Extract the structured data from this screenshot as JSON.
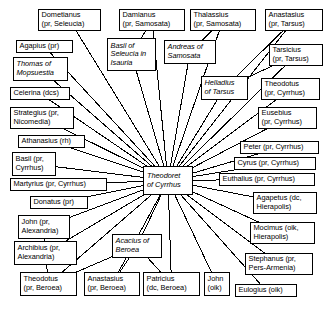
{
  "diagram": {
    "type": "radial-network",
    "background_color": "#ffffff",
    "line_color": "#000000",
    "box_border_color": "#000000",
    "center": {
      "id": "theodoret",
      "label": "Theodoret\nof Cyrrhus",
      "line1": "Theodoret",
      "line2": "of Cyrrhus",
      "style": "italic",
      "x": 143,
      "y": 166,
      "w": 50,
      "h": 29
    },
    "nodes": [
      {
        "id": "dometianus",
        "line1": "Dometianus",
        "line2": "(pr, Seleucia)",
        "style": "normal",
        "x": 38,
        "y": 9,
        "w": 63,
        "h": 22,
        "anchor": "br"
      },
      {
        "id": "damianus",
        "line1": "Damianus",
        "line2": "(pr, Samosata)",
        "style": "normal",
        "x": 119,
        "y": 9,
        "w": 66,
        "h": 22,
        "anchor": "b"
      },
      {
        "id": "thalassius",
        "line1": "Thalassius",
        "line2": "(pr, Samosata)",
        "style": "normal",
        "x": 190,
        "y": 9,
        "w": 66,
        "h": 22,
        "anchor": "b"
      },
      {
        "id": "anastasius-tarsus",
        "line1": "Anastasius",
        "line2": "(pr, Tarsus)",
        "style": "normal",
        "x": 265,
        "y": 9,
        "w": 58,
        "h": 22,
        "anchor": "bl"
      },
      {
        "id": "agapius",
        "line1": "Agapius (pr)",
        "line2": "",
        "style": "normal",
        "x": 16,
        "y": 40,
        "w": 57,
        "h": 13,
        "anchor": "br"
      },
      {
        "id": "basil-seleucia",
        "line1": "Basil of",
        "line2": "Seleucia in",
        "line3": "Isauria",
        "style": "italic",
        "x": 107,
        "y": 38,
        "w": 49,
        "h": 33,
        "anchor": "br"
      },
      {
        "id": "andreas-samosata",
        "line1": "Andreas of",
        "line2": "Samosata",
        "style": "italic",
        "x": 164,
        "y": 40,
        "w": 52,
        "h": 24,
        "anchor": "b"
      },
      {
        "id": "tarsicius",
        "line1": "Tarsicius",
        "line2": "(pr, Tarsus)",
        "style": "normal",
        "x": 269,
        "y": 44,
        "w": 54,
        "h": 22,
        "anchor": "bl"
      },
      {
        "id": "thomas-mopsuestia",
        "line1": "Thomas of",
        "line2": "Mopsuestia",
        "style": "italic",
        "x": 13,
        "y": 57,
        "w": 55,
        "h": 24,
        "anchor": "br"
      },
      {
        "id": "helladius-tarsus",
        "line1": "Helladius",
        "line2": "of Tarsus",
        "style": "italic",
        "x": 201,
        "y": 76,
        "w": 47,
        "h": 24,
        "anchor": "bl"
      },
      {
        "id": "theodotus-cyrrhus",
        "line1": "Theodotus",
        "line2": "(pr, Cyrrhus)",
        "style": "normal",
        "x": 261,
        "y": 78,
        "w": 59,
        "h": 22,
        "anchor": "bl"
      },
      {
        "id": "celerina",
        "line1": "Celerina (dcs)",
        "line2": "",
        "style": "normal",
        "x": 10,
        "y": 87,
        "w": 60,
        "h": 13,
        "anchor": "r"
      },
      {
        "id": "eusebius",
        "line1": "Eusebius",
        "line2": "(pr, Cyrrhus)",
        "style": "normal",
        "x": 258,
        "y": 107,
        "w": 59,
        "h": 22,
        "anchor": "l"
      },
      {
        "id": "strategius",
        "line1": "Strategius (pr,",
        "line2": "Nicomedia)",
        "style": "normal",
        "x": 10,
        "y": 107,
        "w": 64,
        "h": 22,
        "anchor": "r"
      },
      {
        "id": "athanasius",
        "line1": "Athanasius (rh)",
        "line2": "",
        "style": "normal",
        "x": 18,
        "y": 135,
        "w": 67,
        "h": 13,
        "anchor": "r"
      },
      {
        "id": "peter",
        "line1": "Peter (pr, Cyrrhus)",
        "line2": "",
        "style": "normal",
        "x": 240,
        "y": 141,
        "w": 79,
        "h": 13,
        "anchor": "l"
      },
      {
        "id": "cyrus",
        "line1": "Cyrus (pr, Cyrrhus)",
        "line2": "",
        "style": "normal",
        "x": 234,
        "y": 157,
        "w": 82,
        "h": 13,
        "anchor": "l"
      },
      {
        "id": "basil-cyrrhus",
        "line1": "Basil (pr,",
        "line2": "Cyrrhus)",
        "style": "normal",
        "x": 12,
        "y": 152,
        "w": 44,
        "h": 24,
        "anchor": "r"
      },
      {
        "id": "euthalius",
        "line1": "Euthalius (pr, Cyrrhus)",
        "line2": "",
        "style": "normal",
        "x": 219,
        "y": 173,
        "w": 96,
        "h": 13,
        "anchor": "l"
      },
      {
        "id": "martyrius",
        "line1": "Martyrius (pr, Cyrrhus)",
        "line2": "",
        "style": "normal",
        "x": 10,
        "y": 178,
        "w": 97,
        "h": 13,
        "anchor": "r"
      },
      {
        "id": "agapetus",
        "line1": "Agapetus (dc,",
        "line2": "Hierapolis)",
        "style": "normal",
        "x": 253,
        "y": 192,
        "w": 64,
        "h": 22,
        "anchor": "l"
      },
      {
        "id": "donatus",
        "line1": "Donatus (pr)",
        "line2": "",
        "style": "normal",
        "x": 30,
        "y": 196,
        "w": 58,
        "h": 13,
        "anchor": "r"
      },
      {
        "id": "mocimus",
        "line1": "Mocimus (oik,",
        "line2": "Hierapolis)",
        "style": "normal",
        "x": 250,
        "y": 222,
        "w": 65,
        "h": 22,
        "anchor": "l"
      },
      {
        "id": "john-alexandria",
        "line1": "John (pr,",
        "line2": "Alexandria)",
        "style": "normal",
        "x": 18,
        "y": 215,
        "w": 52,
        "h": 24,
        "anchor": "r"
      },
      {
        "id": "archibius",
        "line1": "Archibius (pr,",
        "line2": "Alexandria)",
        "style": "normal",
        "x": 14,
        "y": 241,
        "w": 63,
        "h": 24,
        "anchor": "r"
      },
      {
        "id": "acacius-beroea",
        "line1": "Acacius of",
        "line2": "Beroea",
        "style": "italic",
        "x": 112,
        "y": 234,
        "w": 50,
        "h": 24,
        "anchor": "t"
      },
      {
        "id": "stephanus",
        "line1": "Stephanus (pr,",
        "line2": "Pers-Armenia)",
        "style": "normal",
        "x": 245,
        "y": 253,
        "w": 68,
        "h": 22,
        "anchor": "tl"
      },
      {
        "id": "theodotus-beroea",
        "line1": "Theodotus",
        "line2": "(pr, Beroea)",
        "style": "normal",
        "x": 20,
        "y": 272,
        "w": 57,
        "h": 24,
        "anchor": "t"
      },
      {
        "id": "anastasius-beroea",
        "line1": "Anastasius",
        "line2": "(pr, Beroea)",
        "style": "normal",
        "x": 84,
        "y": 272,
        "w": 56,
        "h": 24,
        "anchor": "t"
      },
      {
        "id": "patricius",
        "line1": "Patricius",
        "line2": "(dc, Beroea)",
        "style": "normal",
        "x": 143,
        "y": 272,
        "w": 57,
        "h": 24,
        "anchor": "t"
      },
      {
        "id": "john-oik",
        "line1": "John",
        "line2": "(oik)",
        "style": "normal",
        "x": 204,
        "y": 272,
        "w": 26,
        "h": 24,
        "anchor": "t"
      },
      {
        "id": "eulogius",
        "line1": "Eulogius (oik)",
        "line2": "",
        "style": "normal",
        "x": 235,
        "y": 284,
        "w": 62,
        "h": 13,
        "anchor": "tl"
      }
    ],
    "edges": [
      {
        "from": "dometianus",
        "to": "theodoret"
      },
      {
        "from": "damianus",
        "to": "theodoret"
      },
      {
        "from": "thalassius",
        "to": "theodoret"
      },
      {
        "from": "anastasius-tarsus",
        "to": "theodoret"
      },
      {
        "from": "agapius",
        "to": "theodoret"
      },
      {
        "from": "basil-seleucia",
        "to": "theodoret"
      },
      {
        "from": "andreas-samosata",
        "to": "theodoret"
      },
      {
        "from": "tarsicius",
        "to": "theodoret"
      },
      {
        "from": "thomas-mopsuestia",
        "to": "theodoret"
      },
      {
        "from": "helladius-tarsus",
        "to": "theodoret"
      },
      {
        "from": "theodotus-cyrrhus",
        "to": "theodoret"
      },
      {
        "from": "celerina",
        "to": "theodoret"
      },
      {
        "from": "eusebius",
        "to": "theodoret"
      },
      {
        "from": "strategius",
        "to": "theodoret"
      },
      {
        "from": "athanasius",
        "to": "theodoret"
      },
      {
        "from": "peter",
        "to": "theodoret"
      },
      {
        "from": "cyrus",
        "to": "theodoret"
      },
      {
        "from": "basil-cyrrhus",
        "to": "theodoret"
      },
      {
        "from": "euthalius",
        "to": "theodoret"
      },
      {
        "from": "martyrius",
        "to": "theodoret"
      },
      {
        "from": "agapetus",
        "to": "theodoret"
      },
      {
        "from": "donatus",
        "to": "theodoret"
      },
      {
        "from": "mocimus",
        "to": "theodoret"
      },
      {
        "from": "john-alexandria",
        "to": "theodoret"
      },
      {
        "from": "archibius",
        "to": "theodoret"
      },
      {
        "from": "acacius-beroea",
        "to": "theodoret"
      },
      {
        "from": "stephanus",
        "to": "theodoret"
      },
      {
        "from": "theodotus-beroea",
        "to": "theodoret"
      },
      {
        "from": "anastasius-beroea",
        "to": "theodoret"
      },
      {
        "from": "patricius",
        "to": "theodoret"
      },
      {
        "from": "john-oik",
        "to": "theodoret"
      },
      {
        "from": "eulogius",
        "to": "theodoret"
      },
      {
        "from": "anastasius-tarsus",
        "to": "helladius-tarsus"
      },
      {
        "from": "tarsicius",
        "to": "helladius-tarsus"
      },
      {
        "from": "thalassius",
        "to": "andreas-samosata"
      },
      {
        "from": "damianus",
        "to": "basil-seleucia"
      },
      {
        "from": "john-alexandria",
        "to": "archibius"
      },
      {
        "from": "acacius-beroea",
        "to": "theodotus-beroea"
      },
      {
        "from": "acacius-beroea",
        "to": "anastasius-beroea"
      },
      {
        "from": "acacius-beroea",
        "to": "patricius"
      },
      {
        "from": "archibius",
        "to": "theodotus-beroea"
      }
    ]
  }
}
